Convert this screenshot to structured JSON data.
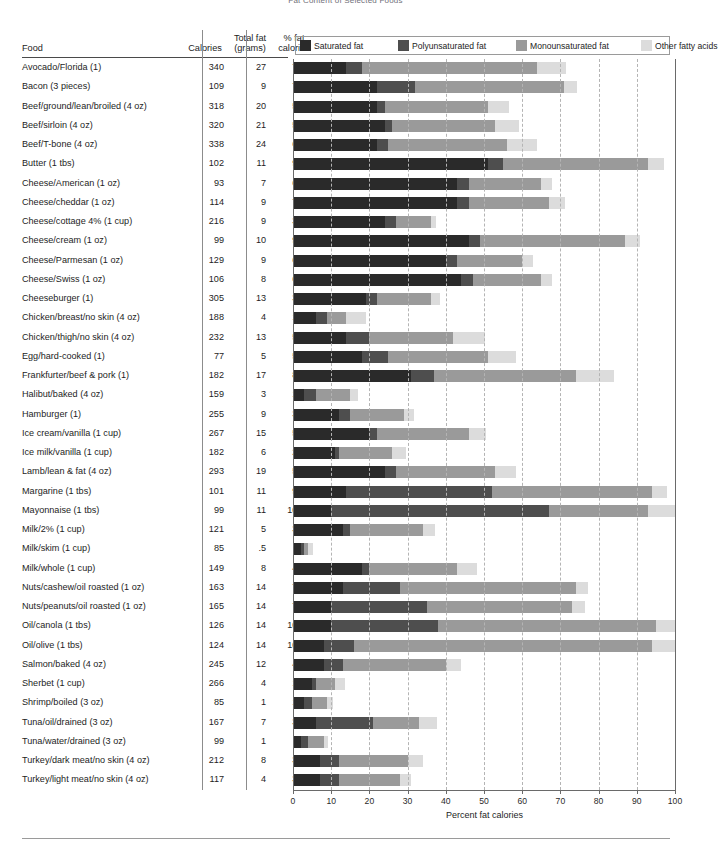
{
  "title": "Fat Content of Selected Foods",
  "headers": {
    "food": "Food",
    "calories": "Calories",
    "total_fat_line1": "Total fat",
    "total_fat_line2": "(grams)",
    "pct_fat_line1": "% fat",
    "pct_fat_line2": "calories"
  },
  "legend": [
    {
      "label": "Saturated fat",
      "color": "#2a2a2a",
      "key": "saturated"
    },
    {
      "label": "Polyunsaturated fat",
      "color": "#4e4e4e",
      "key": "polyunsaturated"
    },
    {
      "label": "Monounsaturated fat",
      "color": "#9a9a9a",
      "key": "monounsaturated"
    },
    {
      "label": "Other fatty acids",
      "color": "#dcdcdc",
      "key": "other"
    }
  ],
  "axis": {
    "title": "Percent fat calories",
    "ticks": [
      0,
      10,
      20,
      30,
      40,
      50,
      60,
      70,
      80,
      90,
      100
    ],
    "min": 0,
    "max": 100
  },
  "chart_data": {
    "type": "bar",
    "subtype": "stacked-horizontal",
    "title": "Fat Content of Selected Foods",
    "xlabel": "Percent fat calories",
    "ylabel": "",
    "xlim": [
      0,
      100
    ],
    "grid": true,
    "legend_position": "top",
    "categories": [
      "Avocado/Florida (1)",
      "Bacon (3 pieces)",
      "Beef/ground/lean/broiled (4 oz)",
      "Beef/sirloin (4 oz)",
      "Beef/T-bone (4 oz)",
      "Butter (1 tbs)",
      "Cheese/American (1 oz)",
      "Cheese/cheddar (1 oz)",
      "Cheese/cottage 4% (1 cup)",
      "Cheese/cream (1 oz)",
      "Cheese/Parmesan (1 oz)",
      "Cheese/Swiss (1 oz)",
      "Cheeseburger (1)",
      "Chicken/breast/no skin (4 oz)",
      "Chicken/thigh/no skin (4 oz)",
      "Egg/hard-cooked (1)",
      "Frankfurter/beef & pork (1)",
      "Halibut/baked (4 oz)",
      "Hamburger (1)",
      "Ice cream/vanilla (1 cup)",
      "Ice milk/vanilla (1 cup)",
      "Lamb/lean & fat (4 oz)",
      "Margarine (1 tbs)",
      "Mayonnaise (1 tbs)",
      "Milk/2% (1 cup)",
      "Milk/skim (1 cup)",
      "Milk/whole (1 cup)",
      "Nuts/cashew/oil roasted (1 oz)",
      "Nuts/peanuts/oil roasted (1 oz)",
      "Oil/canola (1 tbs)",
      "Oil/olive (1 tbs)",
      "Salmon/baked (4 oz)",
      "Sherbet (1 cup)",
      "Shrimp/boiled (3 oz)",
      "Tuna/oil/drained (3 oz)",
      "Tuna/water/drained (3 oz)",
      "Turkey/dark meat/no skin (4 oz)",
      "Turkey/light meat/no skin (4 oz)"
    ],
    "series": [
      {
        "name": "Saturated fat",
        "color": "#2a2a2a",
        "values": [
          14.0,
          22.0,
          22.0,
          24.0,
          22.0,
          51.0,
          43.0,
          43.0,
          24.0,
          46.0,
          40.0,
          44.0,
          19.0,
          6.0,
          14.0,
          18.0,
          31.0,
          3.0,
          12.0,
          20.0,
          11.0,
          24.0,
          14.0,
          10.0,
          13.0,
          2.0,
          18.0,
          13.0,
          10.0,
          10.0,
          8.0,
          8.0,
          5.0,
          3.0,
          6.0,
          2.0,
          7.0,
          7.0
        ]
      },
      {
        "name": "Polyunsaturated fat",
        "color": "#4e4e4e",
        "values": [
          4.0,
          10.0,
          2.0,
          2.0,
          3.0,
          4.0,
          3.0,
          3.0,
          3.0,
          3.0,
          3.0,
          3.0,
          3.0,
          3.0,
          6.0,
          7.0,
          6.0,
          3.0,
          3.0,
          2.0,
          1.0,
          3.0,
          38.0,
          57.0,
          2.0,
          1.0,
          2.0,
          15.0,
          25.0,
          28.0,
          8.0,
          5.0,
          1.0,
          2.0,
          15.0,
          2.0,
          5.0,
          5.0
        ]
      },
      {
        "name": "Monounsaturated fat",
        "color": "#9a9a9a",
        "values": [
          46.0,
          39.0,
          27.0,
          27.0,
          31.0,
          38.0,
          19.0,
          21.0,
          9.0,
          38.0,
          17.0,
          18.0,
          14.0,
          5.0,
          22.0,
          26.0,
          37.0,
          9.0,
          14.0,
          24.0,
          14.0,
          26.0,
          42.0,
          26.0,
          19.0,
          1.0,
          23.0,
          46.0,
          38.0,
          57.0,
          78.0,
          27.0,
          5.0,
          4.0,
          12.0,
          4.0,
          18.0,
          16.0
        ]
      },
      {
        "name": "Other fatty acids",
        "color": "#dcdcdc",
        "values": [
          7.5,
          3.3,
          5.6,
          6.1,
          7.9,
          4.1,
          2.7,
          4.1,
          1.5,
          3.9,
          2.8,
          2.9,
          2.4,
          5.1,
          8.4,
          7.4,
          10.1,
          2.0,
          2.8,
          4.6,
          3.7,
          5.4,
          4.0,
          7.0,
          3.2,
          1.3,
          5.3,
          3.3,
          3.4,
          5.0,
          6.0,
          4.1,
          2.5,
          1.6,
          4.7,
          1.1,
          4.0,
          2.8
        ]
      }
    ],
    "table_columns": [
      "Food",
      "Calories",
      "Total fat (grams)",
      "% fat calories"
    ],
    "rows": [
      {
        "food": "Avocado/Florida (1)",
        "calories": "340",
        "total_fat": "27",
        "pct_fat": "71.5"
      },
      {
        "food": "Bacon (3 pieces)",
        "calories": "109",
        "total_fat": "9",
        "pct_fat": "74.3"
      },
      {
        "food": "Beef/ground/lean/broiled (4 oz)",
        "calories": "318",
        "total_fat": "20",
        "pct_fat": "56.6"
      },
      {
        "food": "Beef/sirloin (4 oz)",
        "calories": "320",
        "total_fat": "21",
        "pct_fat": "59.1"
      },
      {
        "food": "Beef/T-bone (4 oz)",
        "calories": "338",
        "total_fat": "24",
        "pct_fat": "63.9"
      },
      {
        "food": "Butter (1 tbs)",
        "calories": "102",
        "total_fat": "11",
        "pct_fat": "97.1"
      },
      {
        "food": "Cheese/American (1 oz)",
        "calories": "93",
        "total_fat": "7",
        "pct_fat": "67.7"
      },
      {
        "food": "Cheese/cheddar (1 oz)",
        "calories": "114",
        "total_fat": "9",
        "pct_fat": "71.1"
      },
      {
        "food": "Cheese/cottage 4% (1 cup)",
        "calories": "216",
        "total_fat": "9",
        "pct_fat": "37.5"
      },
      {
        "food": "Cheese/cream (1 oz)",
        "calories": "99",
        "total_fat": "10",
        "pct_fat": "90.9"
      },
      {
        "food": "Cheese/Parmesan (1 oz)",
        "calories": "129",
        "total_fat": "9",
        "pct_fat": "62.8"
      },
      {
        "food": "Cheese/Swiss (1 oz)",
        "calories": "106",
        "total_fat": "8",
        "pct_fat": "67.9"
      },
      {
        "food": "Cheeseburger (1)",
        "calories": "305",
        "total_fat": "13",
        "pct_fat": "38.4"
      },
      {
        "food": "Chicken/breast/no skin (4 oz)",
        "calories": "188",
        "total_fat": "4",
        "pct_fat": "19.1"
      },
      {
        "food": "Chicken/thigh/no skin (4 oz)",
        "calories": "232",
        "total_fat": "13",
        "pct_fat": "50.4"
      },
      {
        "food": "Egg/hard-cooked (1)",
        "calories": "77",
        "total_fat": "5",
        "pct_fat": "58.4"
      },
      {
        "food": "Frankfurter/beef & pork (1)",
        "calories": "182",
        "total_fat": "17",
        "pct_fat": "84.1"
      },
      {
        "food": "Halibut/baked (4 oz)",
        "calories": "159",
        "total_fat": "3",
        "pct_fat": "17.0"
      },
      {
        "food": "Hamburger (1)",
        "calories": "255",
        "total_fat": "9",
        "pct_fat": "31.8"
      },
      {
        "food": "Ice cream/vanilla (1 cup)",
        "calories": "267",
        "total_fat": "15",
        "pct_fat": "50.6"
      },
      {
        "food": "Ice milk/vanilla (1 cup)",
        "calories": "182",
        "total_fat": "6",
        "pct_fat": "29.7"
      },
      {
        "food": "Lamb/lean & fat (4 oz)",
        "calories": "293",
        "total_fat": "19",
        "pct_fat": "58.4"
      },
      {
        "food": "Margarine (1 tbs)",
        "calories": "101",
        "total_fat": "11",
        "pct_fat": "98.0"
      },
      {
        "food": "Mayonnaise (1 tbs)",
        "calories": "99",
        "total_fat": "11",
        "pct_fat": "100.0"
      },
      {
        "food": "Milk/2% (1 cup)",
        "calories": "121",
        "total_fat": "5",
        "pct_fat": "37.2"
      },
      {
        "food": "Milk/skim (1 cup)",
        "calories": "85",
        "total_fat": ".5",
        "pct_fat": "5.3"
      },
      {
        "food": "Milk/whole (1 cup)",
        "calories": "149",
        "total_fat": "8",
        "pct_fat": "48.3"
      },
      {
        "food": "Nuts/cashew/oil roasted (1 oz)",
        "calories": "163",
        "total_fat": "14",
        "pct_fat": "77.3"
      },
      {
        "food": "Nuts/peanuts/oil roasted (1 oz)",
        "calories": "165",
        "total_fat": "14",
        "pct_fat": "76.4"
      },
      {
        "food": "Oil/canola (1 tbs)",
        "calories": "126",
        "total_fat": "14",
        "pct_fat": "100.0"
      },
      {
        "food": "Oil/olive (1 tbs)",
        "calories": "124",
        "total_fat": "14",
        "pct_fat": "100.0"
      },
      {
        "food": "Salmon/baked (4 oz)",
        "calories": "245",
        "total_fat": "12",
        "pct_fat": "44.1"
      },
      {
        "food": "Sherbet (1 cup)",
        "calories": "266",
        "total_fat": "4",
        "pct_fat": "13.5"
      },
      {
        "food": "Shrimp/boiled (3 oz)",
        "calories": "85",
        "total_fat": "1",
        "pct_fat": "10.6"
      },
      {
        "food": "Tuna/oil/drained (3 oz)",
        "calories": "167",
        "total_fat": "7",
        "pct_fat": "37.7"
      },
      {
        "food": "Tuna/water/drained (3 oz)",
        "calories": "99",
        "total_fat": "1",
        "pct_fat": "9.1"
      },
      {
        "food": "Turkey/dark meat/no skin (4 oz)",
        "calories": "212",
        "total_fat": "8",
        "pct_fat": "34.0"
      },
      {
        "food": "Turkey/light meat/no skin (4 oz)",
        "calories": "117",
        "total_fat": "4",
        "pct_fat": "30.8"
      }
    ]
  }
}
